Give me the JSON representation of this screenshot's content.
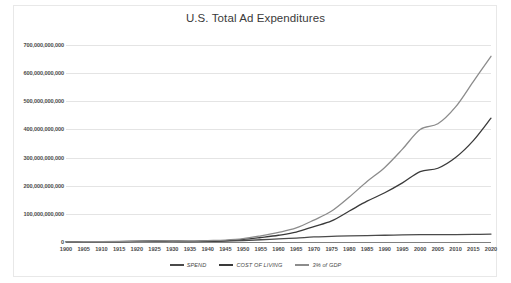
{
  "chart_data": {
    "type": "line",
    "title": "U.S. Total Ad Expenditures",
    "xlabel": "",
    "ylabel": "",
    "grid": true,
    "legend_position": "bottom",
    "xlim": [
      1900,
      2020
    ],
    "ylim": [
      0,
      700000000000
    ],
    "ytick_values": [
      0,
      100000000000,
      200000000000,
      300000000000,
      400000000000,
      500000000000,
      600000000000,
      700000000000
    ],
    "ytick_labels": [
      "0",
      "100,000,000,000",
      "200,000,000,000",
      "300,000,000,000",
      "400,000,000,000",
      "500,000,000,000",
      "600,000,000,000",
      "700,000,000,000"
    ],
    "x": [
      1900,
      1905,
      1910,
      1915,
      1920,
      1925,
      1930,
      1935,
      1940,
      1945,
      1950,
      1955,
      1960,
      1965,
      1970,
      1975,
      1980,
      1985,
      1990,
      1995,
      2000,
      2005,
      2010,
      2015,
      2020
    ],
    "xtick_labels": [
      "1900",
      "1905",
      "1910",
      "1915",
      "1920",
      "1925",
      "1930",
      "1935",
      "1940",
      "1945",
      "1950",
      "1955",
      "1960",
      "1965",
      "1970",
      "1975",
      "1980",
      "1985",
      "1990",
      "1995",
      "2000",
      "2005",
      "2010",
      "2015",
      "2020"
    ],
    "series": [
      {
        "name": "SPEND",
        "color": "#4a4a4a",
        "values": [
          500000000,
          700000000,
          1000000000,
          1200000000,
          2000000000,
          2500000000,
          2000000000,
          1800000000,
          2500000000,
          3000000000,
          5000000000,
          8000000000,
          11000000000,
          14000000000,
          18000000000,
          20000000000,
          22000000000,
          23000000000,
          24000000000,
          25000000000,
          26000000000,
          26000000000,
          26000000000,
          27000000000,
          28000000000
        ]
      },
      {
        "name": "COST OF LIVING",
        "color": "#3a3a3a",
        "values": [
          500000000,
          800000000,
          1200000000,
          1500000000,
          2500000000,
          3500000000,
          3000000000,
          2500000000,
          4000000000,
          5000000000,
          9000000000,
          16000000000,
          24000000000,
          35000000000,
          55000000000,
          75000000000,
          110000000000,
          145000000000,
          175000000000,
          210000000000,
          250000000000,
          262000000000,
          300000000000,
          360000000000,
          440000000000
        ]
      },
      {
        "name": "3% of GDP",
        "color": "#8c8c8c",
        "values": [
          600000000,
          900000000,
          1400000000,
          2000000000,
          3000000000,
          4000000000,
          3500000000,
          3000000000,
          5000000000,
          7000000000,
          12000000000,
          22000000000,
          34000000000,
          50000000000,
          78000000000,
          110000000000,
          160000000000,
          215000000000,
          265000000000,
          330000000000,
          400000000000,
          420000000000,
          480000000000,
          570000000000,
          660000000000
        ]
      }
    ]
  },
  "legend": {
    "items": [
      {
        "label": "SPEND",
        "color": "#4a4a4a"
      },
      {
        "label": "COST OF LIVING",
        "color": "#3a3a3a"
      },
      {
        "label": "3% of GDP",
        "color": "#8c8c8c"
      }
    ]
  },
  "colors": {
    "background": "#ffffff",
    "grid": "#e4e4e4",
    "baseline": "#808080",
    "text": "#4a4a4a",
    "border": "#e8e8e8"
  }
}
